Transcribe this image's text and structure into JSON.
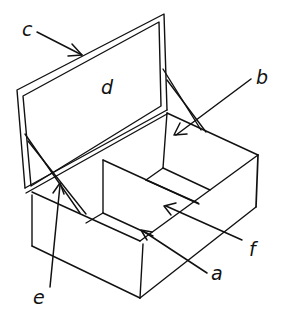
{
  "diagram": {
    "labels": {
      "a": "a",
      "b": "b",
      "c": "c",
      "d": "d",
      "e": "e",
      "f": "f"
    },
    "colors": {
      "line": "#111111",
      "background": "#ffffff"
    }
  }
}
